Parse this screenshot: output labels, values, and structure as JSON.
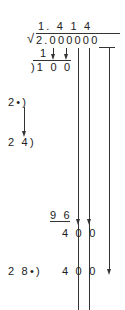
{
  "quotient": "1. 4  1   4",
  "radicand": "2.000000",
  "first_sub": "1",
  "first_rem": ")1 0 0",
  "divisor1": "2•)",
  "divisor2": "2 4)",
  "sub2": "9 6",
  "rem2": "4 0 0",
  "divisor3": "2 8•)",
  "rem3": "4 0 0"
}
